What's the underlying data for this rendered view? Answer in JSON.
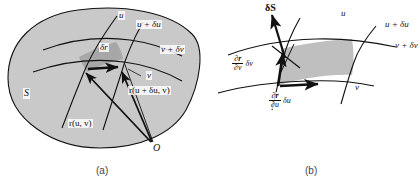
{
  "figure": {
    "background_color": "#ffffff",
    "ink_color": "#111111",
    "surface_fill": "#c9c9c9",
    "element_fill": "#a9a9a9",
    "shaded_patch_fill": "#bfbfbf"
  },
  "panel_a": {
    "caption": "(a)",
    "surface_label": "S",
    "labels": {
      "u_curve": "u",
      "u_plus_du_curve": "u + δu",
      "v_curve": "v",
      "v_plus_dv_curve": "v + δv",
      "delta_r": "δr",
      "position_vector": "r(u, v)",
      "position_vector_shifted": "r(u + δu, v)",
      "origin": "O"
    }
  },
  "panel_b": {
    "caption": "(b)",
    "labels": {
      "vector_area": "δS",
      "u_curve": "u",
      "u_plus_du_curve": "u + δu",
      "v_curve": "v",
      "v_plus_dv_curve": "v + δv",
      "tangent_v_numerator": "∂r",
      "tangent_v_denominator": "∂v",
      "tangent_v_tail": "δv",
      "tangent_u_numerator": "∂r",
      "tangent_u_denominator": "∂u",
      "tangent_u_tail": "δu"
    }
  }
}
